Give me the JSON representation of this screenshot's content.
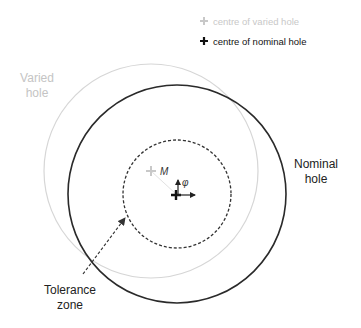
{
  "legend": {
    "varied_center": {
      "symbol": "+",
      "label": "centre of varied hole",
      "color": "#c8c8c8"
    },
    "nominal_center": {
      "symbol": "+",
      "label": "centre of nominal hole",
      "color": "#111111"
    }
  },
  "labels": {
    "varied_hole_line1": "Varied",
    "varied_hole_line2": "hole",
    "nominal_hole_line1": "Nominal",
    "nominal_hole_line2": "hole",
    "tolerance_zone_line1": "Tolerance",
    "tolerance_zone_line2": "zone",
    "point_m": "M",
    "angle_phi": "φ"
  },
  "colors": {
    "nominal": "#2a2a2a",
    "varied": "#d4d4d4",
    "varied_text": "#c4c4c4",
    "tolerance": "#333333"
  }
}
